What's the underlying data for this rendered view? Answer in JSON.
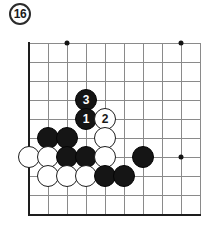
{
  "figure": {
    "number_label": "16",
    "badge_name": "figure-number-badge"
  },
  "board": {
    "type": "go-board-diagram",
    "origin_x": 29,
    "origin_y": 43,
    "cell": 19,
    "cols": 10,
    "rows": 10,
    "grid_color": "#8a8a8a",
    "edge_color": "#1d1d1d",
    "background": "#ffffff",
    "edges": [
      "left",
      "bottom"
    ],
    "star_points": [
      {
        "col": 2,
        "row": 0
      },
      {
        "col": 8,
        "row": 0
      },
      {
        "col": 8,
        "row": 6
      }
    ],
    "stones": [
      {
        "col": 3,
        "row": 3,
        "color": "black",
        "number": "3"
      },
      {
        "col": 3,
        "row": 4,
        "color": "black",
        "number": "1"
      },
      {
        "col": 4,
        "row": 4,
        "color": "white",
        "number": "2"
      },
      {
        "col": 4,
        "row": 5,
        "color": "white",
        "number": ""
      },
      {
        "col": 1,
        "row": 5,
        "color": "black",
        "number": ""
      },
      {
        "col": 2,
        "row": 5,
        "color": "black",
        "number": ""
      },
      {
        "col": 0,
        "row": 6,
        "color": "white",
        "number": ""
      },
      {
        "col": 1,
        "row": 6,
        "color": "white",
        "number": ""
      },
      {
        "col": 2,
        "row": 6,
        "color": "black",
        "number": ""
      },
      {
        "col": 3,
        "row": 6,
        "color": "black",
        "number": ""
      },
      {
        "col": 4,
        "row": 6,
        "color": "white",
        "number": ""
      },
      {
        "col": 6,
        "row": 6,
        "color": "black",
        "number": ""
      },
      {
        "col": 1,
        "row": 7,
        "color": "white",
        "number": ""
      },
      {
        "col": 2,
        "row": 7,
        "color": "white",
        "number": ""
      },
      {
        "col": 3,
        "row": 7,
        "color": "white",
        "number": ""
      },
      {
        "col": 4,
        "row": 7,
        "color": "black",
        "number": ""
      },
      {
        "col": 5,
        "row": 7,
        "color": "black",
        "number": ""
      }
    ],
    "colors": {
      "black_stone": "#151515",
      "white_stone": "#ffffff",
      "stone_outline": "#1d1d1d",
      "black_number_text": "#ffffff",
      "white_number_text": "#1a1a1a"
    }
  }
}
